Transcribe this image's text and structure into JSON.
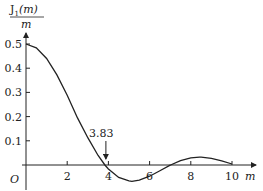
{
  "chart_data": {
    "type": "line",
    "title": "",
    "ylabel": "J1(m)/m",
    "ylabel_numerator": "J",
    "ylabel_subscript": "1",
    "ylabel_arg": "(m)",
    "ylabel_denominator": "m",
    "xlabel": "m",
    "origin_label": "O",
    "xlim": [
      0,
      10.5
    ],
    "ylim": [
      -0.08,
      0.55
    ],
    "x_ticks": [
      2,
      4,
      6,
      8,
      10
    ],
    "x_tick_labels": [
      "2",
      "4",
      "6",
      "8",
      "10"
    ],
    "y_ticks": [
      0.1,
      0.2,
      0.3,
      0.4,
      0.5
    ],
    "y_tick_labels": [
      "0.1",
      "0.2",
      "0.3",
      "0.4",
      "0.5"
    ],
    "grid": false,
    "annotation": {
      "text": "3.83",
      "x": 3.83,
      "y": 0,
      "arrow": true
    },
    "series": [
      {
        "name": "J1(m)/m",
        "x": [
          0,
          0.5,
          1,
          1.5,
          2,
          2.5,
          3,
          3.5,
          3.83,
          4,
          4.5,
          5,
          5.14,
          5.5,
          6,
          6.5,
          7,
          7.02,
          7.5,
          8,
          8.42,
          8.5,
          9,
          9.5,
          10
        ],
        "values": [
          0.5,
          0.4845,
          0.4401,
          0.3725,
          0.2884,
          0.1946,
          0.113,
          0.0393,
          0.0,
          -0.0165,
          -0.0512,
          -0.0655,
          -0.0676,
          -0.0622,
          -0.0461,
          -0.0235,
          -0.0007,
          0.0,
          0.018,
          0.0293,
          0.0324,
          0.0322,
          0.0272,
          0.017,
          0.0043
        ]
      }
    ]
  }
}
